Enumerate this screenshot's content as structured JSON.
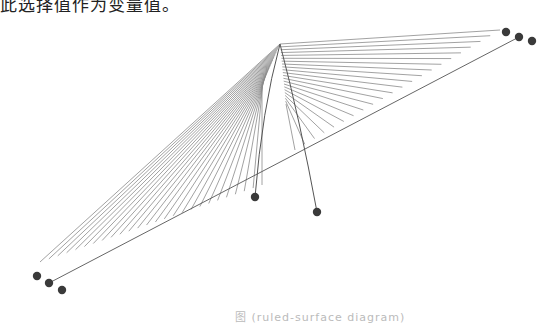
{
  "top_text": "此选择值作为变量值。",
  "caption": "图 (ruled-surface diagram)",
  "diagram": {
    "type": "ruled-surface line diagram",
    "apex": [
      280,
      44
    ],
    "colors": {
      "line": "#8a8a8a",
      "curve": "#555555",
      "node": "#3a3a3a"
    },
    "right_fan": {
      "count": 22,
      "end_start": [
        500,
        30
      ],
      "end_end": [
        295,
        150
      ]
    },
    "left_fan": {
      "count": 26,
      "end_start": [
        40,
        262
      ],
      "end_end": [
        262,
        185
      ]
    },
    "nodes": [
      {
        "id": "tr1",
        "x": 506,
        "y": 32
      },
      {
        "id": "tr2",
        "x": 519,
        "y": 37
      },
      {
        "id": "tr3",
        "x": 532,
        "y": 41
      },
      {
        "id": "bl1",
        "x": 37,
        "y": 276
      },
      {
        "id": "bl2",
        "x": 49,
        "y": 283
      },
      {
        "id": "bl3",
        "x": 62,
        "y": 290
      },
      {
        "id": "mid1",
        "x": 255,
        "y": 197
      },
      {
        "id": "mid2",
        "x": 317,
        "y": 212
      }
    ],
    "long_line": {
      "from": [
        49,
        283
      ],
      "to": [
        519,
        37
      ]
    }
  }
}
